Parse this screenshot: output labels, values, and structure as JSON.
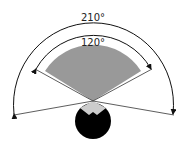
{
  "diagram": {
    "outer_angle_label": "210°",
    "inner_angle_label": "120°",
    "colors": {
      "fan": "#999999",
      "tip": "#cccccc",
      "head": "#000000",
      "lines": "#333333"
    }
  }
}
